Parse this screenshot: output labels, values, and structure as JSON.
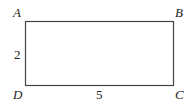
{
  "figure": {
    "shape": "rectangle",
    "stroke_color": "#444444",
    "vertices": {
      "A": {
        "label": "A",
        "position": "top-left"
      },
      "B": {
        "label": "B",
        "position": "top-right"
      },
      "C": {
        "label": "C",
        "position": "bottom-right"
      },
      "D": {
        "label": "D",
        "position": "bottom-left"
      }
    },
    "sides": {
      "AD": {
        "label": "2"
      },
      "DC": {
        "label": "5"
      }
    }
  }
}
